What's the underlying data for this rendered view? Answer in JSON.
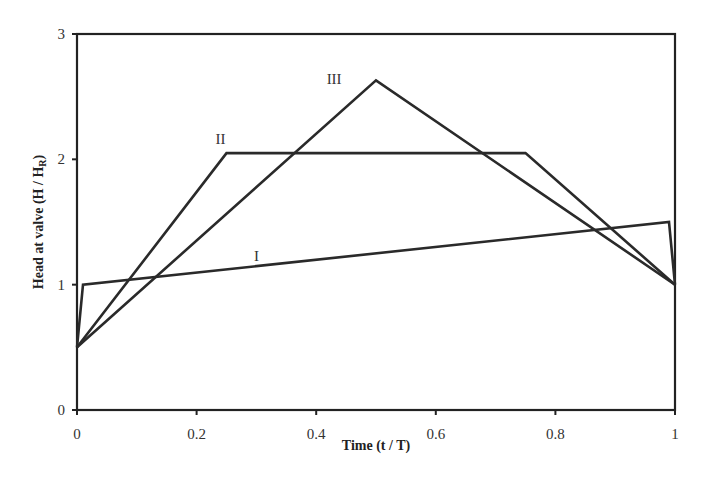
{
  "chart_data": {
    "type": "line",
    "title": "",
    "xlabel": "Time (t / T)",
    "ylabel": "Head at valve (H / H",
    "ylabel_sub": "R",
    "ylabel_close": ")",
    "xlim": [
      0,
      1
    ],
    "ylim": [
      0,
      3
    ],
    "xticks": [
      "0",
      "0.2",
      "0.4",
      "0.6",
      "0.8",
      "1"
    ],
    "yticks": [
      "0",
      "1",
      "2",
      "3"
    ],
    "grid": false,
    "legend": "inline labels",
    "series": [
      {
        "name": "I",
        "x": [
          0,
          0.01,
          0.99,
          1.0
        ],
        "y": [
          0.5,
          1.0,
          1.5,
          1.0
        ]
      },
      {
        "name": "II",
        "x": [
          0,
          0.25,
          0.75,
          1.0
        ],
        "y": [
          0.5,
          2.05,
          2.05,
          1.0
        ]
      },
      {
        "name": "III",
        "x": [
          0,
          0.5,
          1.0
        ],
        "y": [
          0.5,
          2.63,
          1.0
        ]
      }
    ],
    "annotations": [
      {
        "text": "I",
        "x": 0.3,
        "y": 1.19
      },
      {
        "text": "II",
        "x": 0.24,
        "y": 2.12
      },
      {
        "text": "III",
        "x": 0.43,
        "y": 2.6
      }
    ]
  }
}
